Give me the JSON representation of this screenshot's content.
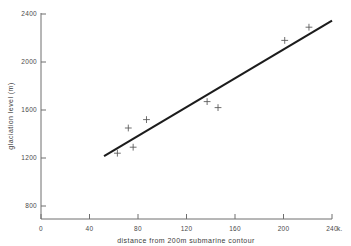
{
  "chart_data": {
    "type": "scatter",
    "title": "",
    "xlabel": "distance from 200m submarine contour",
    "ylabel": "glaciation level (m)",
    "x_unit": "k.",
    "xlim": [
      0,
      240
    ],
    "ylim": [
      800,
      2400
    ],
    "xticks": [
      0,
      40,
      80,
      120,
      160,
      200,
      240
    ],
    "yticks": [
      800,
      1200,
      1600,
      2000,
      2400
    ],
    "xtick_labels": [
      "0",
      "40",
      "80",
      "120",
      "160",
      "200",
      "240"
    ],
    "ytick_labels": [
      "800",
      "1200",
      "1600",
      "2000",
      "2400"
    ],
    "grid": false,
    "legend": "none",
    "points": [
      {
        "x": 63,
        "y": 1240
      },
      {
        "x": 72,
        "y": 1450
      },
      {
        "x": 76,
        "y": 1290
      },
      {
        "x": 87,
        "y": 1520
      },
      {
        "x": 137,
        "y": 1670
      },
      {
        "x": 146,
        "y": 1620
      },
      {
        "x": 201,
        "y": 2180
      },
      {
        "x": 221,
        "y": 2290
      }
    ],
    "marker": "plus",
    "trend_line": {
      "x_start": 52,
      "y_start": 1215,
      "x_end": 240,
      "y_end": 2345
    },
    "series": [
      {
        "name": "glaciation level",
        "x": [
          63,
          72,
          76,
          87,
          137,
          146,
          201,
          221
        ],
        "values": [
          1240,
          1450,
          1290,
          1520,
          1670,
          1620,
          2180,
          2290
        ]
      }
    ]
  },
  "colors": {
    "axis": "#6e6e6e",
    "line": "#1c1c1c",
    "marker": "#555555",
    "text": "#3a3a3a",
    "background": "#ffffff"
  }
}
